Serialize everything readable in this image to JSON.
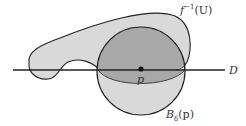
{
  "figure": {
    "labels": {
      "preimage": {
        "base": "f",
        "sup": "−1",
        "arg": "(U)"
      },
      "ball": {
        "base": "B",
        "sub": "δ",
        "arg": "(p)"
      },
      "point": "p",
      "line": "D"
    },
    "colors": {
      "preimage_fill": "#d9d9d9",
      "intersection_fill": "#a8a8a8",
      "ball_fill": "#d9d9d9",
      "stroke": "#222222",
      "point": "#111111"
    }
  }
}
